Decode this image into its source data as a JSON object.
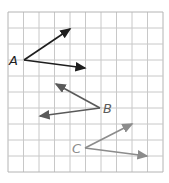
{
  "grid": {
    "x0": 8,
    "y0": 12,
    "cols": 10,
    "rows": 10,
    "cell_w": 15.5,
    "cell_h": 16,
    "line_color": "#c8c8c8",
    "border_color": "#b4b4b4"
  },
  "angles": [
    {
      "label": "A",
      "color": "#1e1e1e",
      "vertex": [
        24,
        60
      ],
      "ray1": [
        70,
        29
      ],
      "ray2": [
        85,
        68
      ],
      "label_pos": [
        9,
        65
      ]
    },
    {
      "label": "B",
      "color": "#5a5a5a",
      "vertex": [
        100,
        108
      ],
      "ray1": [
        56,
        84
      ],
      "ray2": [
        40,
        116
      ],
      "label_pos": [
        103,
        113
      ]
    },
    {
      "label": "C",
      "color": "#8c8c8c",
      "vertex": [
        85,
        148
      ],
      "ray1": [
        132,
        124
      ],
      "ray2": [
        147,
        156
      ],
      "label_pos": [
        72,
        153
      ]
    }
  ]
}
